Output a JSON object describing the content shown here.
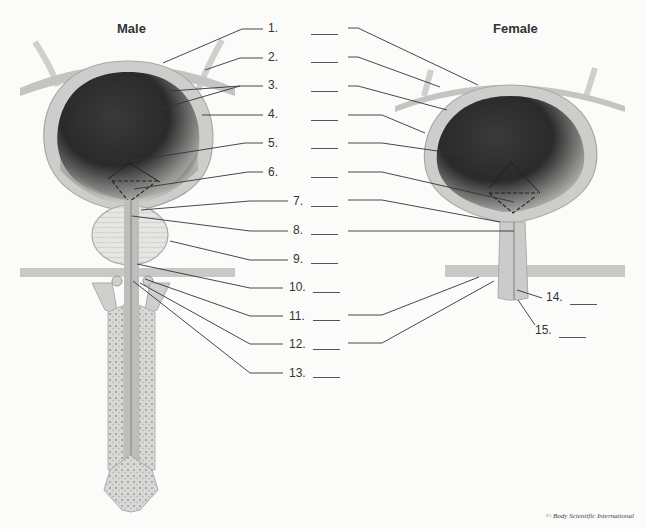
{
  "diagram": {
    "titles": {
      "male": "Male",
      "female": "Female"
    },
    "labels": [
      {
        "n": "1.",
        "x": 268,
        "y": 27
      },
      {
        "n": "2.",
        "x": 268,
        "y": 55
      },
      {
        "n": "3.",
        "x": 268,
        "y": 84
      },
      {
        "n": "4.",
        "x": 268,
        "y": 113
      },
      {
        "n": "5.",
        "x": 268,
        "y": 142
      },
      {
        "n": "6.",
        "x": 268,
        "y": 171
      },
      {
        "n": "7.",
        "x": 293,
        "y": 200
      },
      {
        "n": "8.",
        "x": 293,
        "y": 229
      },
      {
        "n": "9.",
        "x": 293,
        "y": 258
      },
      {
        "n": "10.",
        "x": 289,
        "y": 286
      },
      {
        "n": "11.",
        "x": 289,
        "y": 315
      },
      {
        "n": "12.",
        "x": 289,
        "y": 343
      },
      {
        "n": "13.",
        "x": 289,
        "y": 372
      },
      {
        "n": "14.",
        "x": 546,
        "y": 296
      },
      {
        "n": "15.",
        "x": 535,
        "y": 329
      }
    ],
    "blank_line": "____",
    "credit": "© Body Scientific International"
  },
  "colors": {
    "background": "#fbfbfa",
    "bladder_wall": "#c9c9c7",
    "lumen_dark": "#2a2a2a",
    "leader_line": "#333333"
  }
}
